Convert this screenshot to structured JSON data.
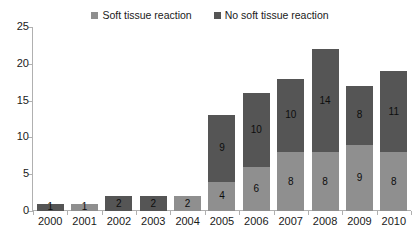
{
  "colors": {
    "soft_tissue": "#8f8f8f",
    "no_soft_tissue": "#555555",
    "axis": "#b0b0b0",
    "text": "#1a1a1a",
    "background": "#ffffff"
  },
  "legend": {
    "items": [
      {
        "label": "Soft tissue reaction",
        "color": "#8f8f8f"
      },
      {
        "label": "No soft tissue reaction",
        "color": "#555555"
      }
    ]
  },
  "axes": {
    "y_ticks": [
      "0",
      "5",
      "10",
      "15",
      "20",
      "25"
    ],
    "y_min": 0,
    "y_max": 25,
    "x_labels": [
      "2000",
      "2001",
      "2002",
      "2003",
      "2004",
      "2005",
      "2006",
      "2007",
      "2008",
      "2009",
      "2010"
    ]
  },
  "chart_data": {
    "type": "bar",
    "title": "",
    "subtitle": "",
    "xlabel": "",
    "ylabel": "",
    "ylim": [
      0,
      25
    ],
    "grid": false,
    "stacked": true,
    "legend_position": "top-center",
    "categories": [
      "2000",
      "2001",
      "2002",
      "2003",
      "2004",
      "2005",
      "2006",
      "2007",
      "2008",
      "2009",
      "2010"
    ],
    "series": [
      {
        "name": "Soft tissue reaction",
        "color": "#8f8f8f",
        "values": [
          0,
          1,
          0,
          0,
          2,
          4,
          6,
          8,
          8,
          9,
          8
        ],
        "labels": [
          "",
          "1",
          "",
          "",
          "2",
          "4",
          "6",
          "8",
          "8",
          "9",
          "8"
        ]
      },
      {
        "name": "No soft tissue reaction",
        "color": "#555555",
        "values": [
          1,
          0,
          2,
          2,
          0,
          9,
          10,
          10,
          14,
          8,
          11
        ],
        "labels": [
          "1",
          "",
          "2",
          "2",
          "",
          "9",
          "10",
          "10",
          "14",
          "8",
          "11"
        ]
      }
    ],
    "totals": [
      1,
      1,
      2,
      2,
      2,
      13,
      16,
      18,
      22,
      17,
      19
    ]
  }
}
